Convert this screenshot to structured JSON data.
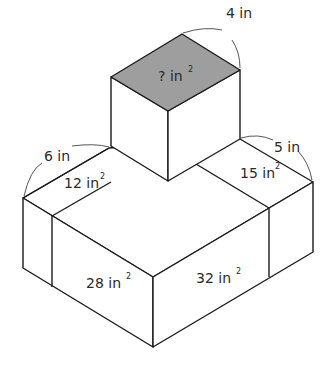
{
  "figure": {
    "type": "composite rectangular prisms",
    "colors": {
      "shaded_face": "#9e9e9e",
      "lines": "#1a1a1a",
      "background": "#ffffff"
    },
    "dimensions": [
      {
        "id": "top-cube-edge",
        "text": "4 in"
      },
      {
        "id": "base-left-edge",
        "text": "6 in"
      },
      {
        "id": "base-right-edge",
        "text": "5 in"
      }
    ],
    "areas": [
      {
        "id": "top-face",
        "value": "?",
        "unit": "in",
        "exp": "2"
      },
      {
        "id": "left-top-strip",
        "value": "12",
        "unit": "in",
        "exp": "2"
      },
      {
        "id": "right-top-strip",
        "value": "15",
        "unit": "in",
        "exp": "2"
      },
      {
        "id": "front-left-face",
        "value": "28",
        "unit": "in",
        "exp": "2"
      },
      {
        "id": "front-right-face",
        "value": "32",
        "unit": "in",
        "exp": "2"
      }
    ]
  }
}
